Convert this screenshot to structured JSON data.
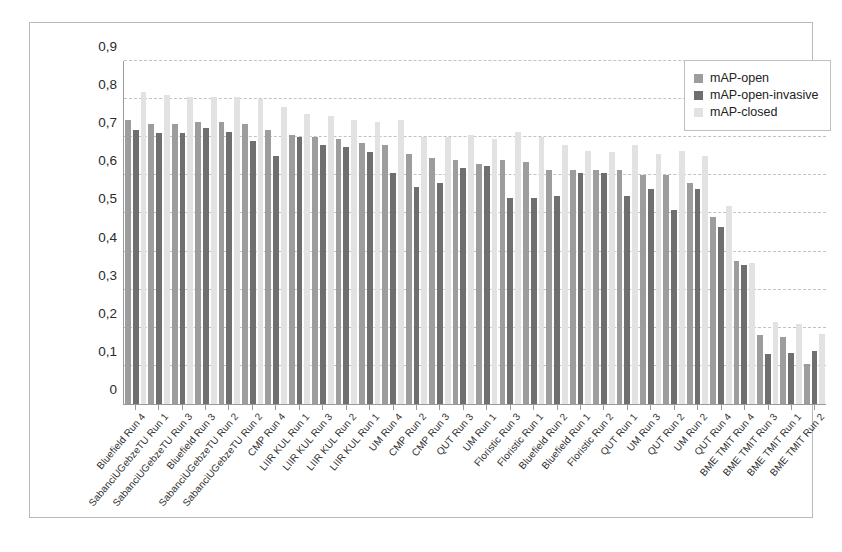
{
  "chart_data": {
    "type": "bar",
    "title": "",
    "subtitle": "",
    "xlabel": "",
    "ylabel": "",
    "ylim": [
      0,
      0.9
    ],
    "ytick_labels": [
      "0",
      "0,1",
      "0,2",
      "0,3",
      "0,4",
      "0,5",
      "0,6",
      "0,7",
      "0,8",
      "0,9"
    ],
    "ytick_values": [
      0,
      0.1,
      0.2,
      0.3,
      0.4,
      0.5,
      0.6,
      0.7,
      0.8,
      0.9
    ],
    "grid": true,
    "grid_style": "dashed-horizontal",
    "legend_position": "top-right",
    "decimal_separator": ",",
    "categories": [
      "Bluefield Run 4",
      "SabanciUGebzeTU Run 1",
      "SabanciUGebzeTU Run 3",
      "Bluefield Run 3",
      "SabanciUGebzeTU Run 2",
      "SabanciUGebzeTU Run 2",
      "CMP Run 4",
      "LIIR KUL Run 1",
      "LIIR KUL Run 3",
      "LIIR KUL Run 2",
      "LIIR KUL Run 1",
      "UM Run 4",
      "CMP Run 2",
      "CMP Run 3",
      "QUT Run 3",
      "UM Run 1",
      "Floristic Run 3",
      "Floristic Run 1",
      "Bluefield Run 2",
      "Bluefield Run 1",
      "Floristic Run 2",
      "QUT Run 1",
      "UM Run 3",
      "QUT Run 2",
      "UM Run 2",
      "QUT Run 4",
      "BME TMIT Run 4",
      "BME TMIT Run 3",
      "BME TMIT Run 1",
      "BME TMIT Run 2"
    ],
    "series": [
      {
        "name": "mAP-open",
        "color": "#9d9d9d",
        "values": [
          0.745,
          0.735,
          0.735,
          0.74,
          0.74,
          0.735,
          0.72,
          0.705,
          0.7,
          0.695,
          0.685,
          0.68,
          0.655,
          0.645,
          0.64,
          0.63,
          0.64,
          0.635,
          0.615,
          0.615,
          0.615,
          0.615,
          0.6,
          0.6,
          0.58,
          0.49,
          0.375,
          0.18,
          0.175,
          0.105
        ]
      },
      {
        "name": "mAP-open-invasive",
        "color": "#6f6f6f",
        "values": [
          0.72,
          0.71,
          0.71,
          0.725,
          0.715,
          0.69,
          0.65,
          0.7,
          0.68,
          0.675,
          0.66,
          0.605,
          0.57,
          0.58,
          0.62,
          0.625,
          0.54,
          0.54,
          0.545,
          0.605,
          0.605,
          0.545,
          0.565,
          0.51,
          0.565,
          0.465,
          0.365,
          0.13,
          0.135,
          0.14
        ]
      },
      {
        "name": "mAP-closed",
        "color": "#e2e2e2",
        "values": [
          0.82,
          0.81,
          0.805,
          0.805,
          0.805,
          0.8,
          0.78,
          0.76,
          0.755,
          0.745,
          0.74,
          0.745,
          0.7,
          0.7,
          0.705,
          0.695,
          0.715,
          0.7,
          0.68,
          0.665,
          0.66,
          0.68,
          0.655,
          0.665,
          0.65,
          0.52,
          0.37,
          0.215,
          0.21,
          0.185
        ]
      }
    ]
  },
  "legend": {
    "items": [
      {
        "label": "mAP-open",
        "color": "#9d9d9d"
      },
      {
        "label": "mAP-open-invasive",
        "color": "#6f6f6f"
      },
      {
        "label": "mAP-closed",
        "color": "#e2e2e2"
      }
    ]
  }
}
